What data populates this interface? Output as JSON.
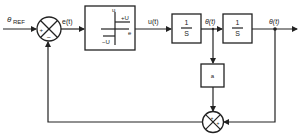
{
  "diagram": {
    "signals": {
      "reference": "θ",
      "reference_sub": "REF",
      "error": "e(t)",
      "control": "u(t)",
      "velocity": "θ̇(t)",
      "position": "θ(t)"
    },
    "relay_block": {
      "axis_y_label": "u",
      "axis_x_label": "e",
      "upper_level": "+U",
      "lower_level": "−U"
    },
    "integrator_1": {
      "numerator": "1",
      "denominator": "S"
    },
    "integrator_2": {
      "numerator": "1",
      "denominator": "S"
    },
    "gain_block": {
      "label": "a"
    },
    "summer_main": {
      "top_left_sign": "+",
      "bottom_sign": "−"
    },
    "summer_feedback": {
      "top_sign": "+",
      "right_sign": "+"
    }
  }
}
